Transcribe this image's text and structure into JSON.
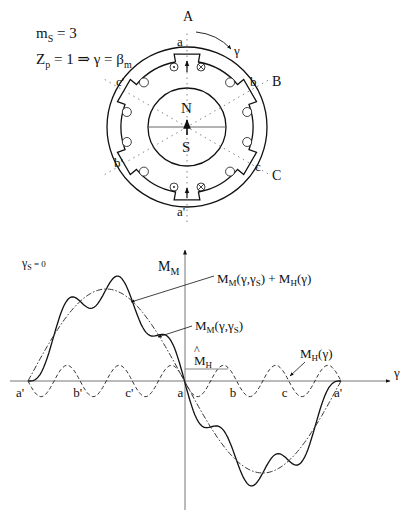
{
  "motor": {
    "params": {
      "m_main": "m",
      "m_sub": "S",
      "m_rest": " = 3",
      "z_main": "Z",
      "z_sub": "p",
      "z_rest": " = 1 ⇒ γ = β",
      "z_sub2": "m"
    },
    "axis_labels": {
      "A": "A",
      "B": "B",
      "C": "C"
    },
    "coil_labels": {
      "a": "a",
      "a_prime": "a'",
      "b": "b",
      "b_prime": "b'",
      "c": "c",
      "c_prime": "c'"
    },
    "rotor_poles": {
      "north": "N",
      "south": "S"
    },
    "rotation_label": "γ",
    "icons": [
      "current-dot-icon",
      "current-cross-icon",
      "flux-arrow-icon",
      "rotation-arrow-icon"
    ]
  },
  "chart_data": {
    "type": "line",
    "title": "",
    "condition_main": "γ",
    "condition_sub": "S",
    "condition_rest": " = 0",
    "xlabel": "γ",
    "ylabel_main": "M",
    "ylabel_sub": "M",
    "x_tick_labels": [
      "a'",
      "b'",
      "c'",
      "a",
      "b",
      "c",
      "a'"
    ],
    "x_range_deg": [
      -180,
      180
    ],
    "series": [
      {
        "name": "M_M(γ,γ_S) + M_H(γ)",
        "style": "solid",
        "label_parts": [
          "M",
          "M",
          "(γ,γ",
          "S",
          ") + M",
          "H",
          "(γ)"
        ],
        "description": "fundamental sinusoid plus 6th harmonic ripple"
      },
      {
        "name": "M_M(γ,γ_S)",
        "style": "dash-dot",
        "label_parts": [
          "M",
          "M",
          "(γ,γ",
          "S",
          ")"
        ],
        "description": "fundamental: -sin(γ), amplitude 1"
      },
      {
        "name": "M_H(γ)",
        "style": "dashed",
        "label_parts": [
          "M",
          "H",
          "(γ)"
        ],
        "description": "harmonic: -0.17·sin(6γ)"
      }
    ],
    "annotation": {
      "main": "M",
      "sub": "H",
      "hat": "^",
      "meaning": "harmonic amplitude"
    },
    "fundamental_amplitude": 1.0,
    "harmonic_amplitude": 0.17,
    "harmonic_order": 6
  }
}
